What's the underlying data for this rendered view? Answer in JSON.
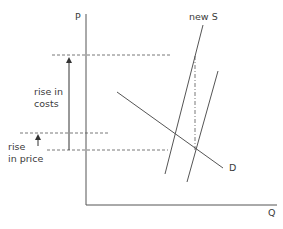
{
  "diagram": {
    "type": "supply-demand",
    "axes": {
      "y_label": "P",
      "x_label": "Q"
    },
    "curves": {
      "new_supply_label": "new S",
      "demand_label": "D"
    },
    "annotations": {
      "rise_in_costs_line1": "rise in",
      "rise_in_costs_line2": "costs",
      "rise_in_price_line1": "rise",
      "rise_in_price_line2": "in price"
    },
    "colors": {
      "line": "#555555",
      "text": "#3a3a3a",
      "background": "#ffffff"
    }
  }
}
